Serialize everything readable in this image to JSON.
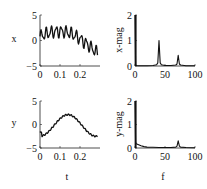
{
  "chart_data": [
    {
      "type": "line",
      "id": "x-time",
      "title": "",
      "xlabel": "",
      "ylabel": "x",
      "xlim": [
        0,
        0.3
      ],
      "ylim": [
        -5,
        5
      ],
      "xticks": [
        0,
        0.1,
        0.2
      ],
      "xtick_labels": [
        "0",
        "0.1",
        "0.2"
      ],
      "yticks": [
        -5,
        0,
        5
      ],
      "ytick_labels": [
        "−5",
        "0",
        "5"
      ],
      "grid": false,
      "description": "Noisy oscillating signal: slow trend rising to ~2 near t=0.1 then declining to ~-2 near t=0.27, with fast oscillation (~40 Hz, amplitude ~1) and a ~72 Hz component (amplitude ~0.4)",
      "x": [
        0,
        0.01,
        0.02,
        0.03,
        0.04,
        0.05,
        0.06,
        0.07,
        0.08,
        0.09,
        0.1,
        0.11,
        0.12,
        0.13,
        0.14,
        0.15,
        0.16,
        0.17,
        0.18,
        0.19,
        0.2,
        0.21,
        0.22,
        0.23,
        0.24,
        0.25,
        0.26,
        0.27,
        0.28,
        0.29
      ],
      "values": [
        -0.5,
        1.2,
        0.6,
        2.0,
        1.0,
        2.6,
        1.2,
        2.8,
        1.1,
        3.0,
        1.2,
        2.6,
        0.8,
        2.3,
        0.4,
        1.8,
        -0.3,
        1.2,
        -0.9,
        0.5,
        -1.5,
        0.0,
        -2.0,
        -0.6,
        -2.4,
        -1.0,
        -2.6,
        -0.8,
        -2.0,
        0.2
      ]
    },
    {
      "type": "line",
      "id": "x-spectrum",
      "title": "",
      "xlabel": "",
      "ylabel": "x-mag",
      "xlim": [
        0,
        100
      ],
      "ylim": [
        0,
        2
      ],
      "xticks": [
        0,
        50,
        100
      ],
      "xtick_labels": [
        "0",
        "50",
        "100"
      ],
      "yticks": [
        0,
        1,
        2
      ],
      "ytick_labels": [
        "0",
        "1",
        "2"
      ],
      "grid": false,
      "peaks": [
        {
          "f": 0,
          "mag": 2.0
        },
        {
          "f": 40,
          "mag": 1.0
        },
        {
          "f": 72,
          "mag": 0.42
        }
      ],
      "x": [
        0,
        1,
        2,
        5,
        10,
        20,
        30,
        36,
        38,
        40,
        42,
        44,
        50,
        60,
        68,
        70,
        72,
        74,
        76,
        85,
        100
      ],
      "values": [
        2.0,
        0.05,
        0.02,
        0.01,
        0.01,
        0.01,
        0.02,
        0.05,
        0.12,
        1.0,
        0.12,
        0.05,
        0.02,
        0.02,
        0.04,
        0.08,
        0.42,
        0.08,
        0.04,
        0.01,
        0.01
      ]
    },
    {
      "type": "line",
      "id": "y-time",
      "title": "",
      "xlabel": "t",
      "ylabel": "y",
      "xlim": [
        0,
        0.3
      ],
      "ylim": [
        -5,
        5
      ],
      "xticks": [
        0,
        0.1,
        0.2
      ],
      "xtick_labels": [
        "0",
        "0.1",
        "0.2"
      ],
      "yticks": [
        -5,
        0,
        5
      ],
      "ytick_labels": [
        "−5",
        "0",
        "5"
      ],
      "grid": false,
      "description": "Smooth signal: starts ~0.3, dips slightly ~-0.3, rises to peak ~2.2 near t=0.14, declines to ~-2 at t=0.29, with small high-frequency ripple",
      "x": [
        0,
        0.01,
        0.02,
        0.03,
        0.04,
        0.05,
        0.06,
        0.07,
        0.08,
        0.09,
        0.1,
        0.11,
        0.12,
        0.13,
        0.14,
        0.15,
        0.16,
        0.17,
        0.18,
        0.19,
        0.2,
        0.21,
        0.22,
        0.23,
        0.24,
        0.25,
        0.26,
        0.27,
        0.28,
        0.29
      ],
      "values": [
        0.8,
        -0.2,
        -0.3,
        -0.2,
        0.0,
        0.2,
        0.5,
        0.9,
        1.3,
        1.6,
        1.9,
        2.1,
        2.2,
        2.2,
        2.1,
        1.9,
        1.6,
        1.2,
        0.8,
        0.4,
        -0.1,
        -0.5,
        -0.9,
        -1.2,
        -1.5,
        -1.7,
        -1.8,
        -1.9,
        -2.0,
        -1.7
      ]
    },
    {
      "type": "line",
      "id": "y-spectrum",
      "title": "",
      "xlabel": "f",
      "ylabel": "y-mag",
      "xlim": [
        0,
        100
      ],
      "ylim": [
        0,
        2
      ],
      "xticks": [
        0,
        50,
        100
      ],
      "xtick_labels": [
        "0",
        "50",
        "100"
      ],
      "yticks": [
        0,
        1,
        2
      ],
      "ytick_labels": [
        "0",
        "1",
        "2"
      ],
      "grid": false,
      "peaks": [
        {
          "f": 0,
          "mag": 2.0
        },
        {
          "f": 72,
          "mag": 0.3
        }
      ],
      "x": [
        0,
        1,
        2,
        5,
        10,
        15,
        20,
        30,
        40,
        50,
        60,
        68,
        70,
        72,
        74,
        76,
        85,
        100
      ],
      "values": [
        2.0,
        0.25,
        0.18,
        0.15,
        0.1,
        0.06,
        0.04,
        0.03,
        0.02,
        0.02,
        0.02,
        0.04,
        0.08,
        0.3,
        0.08,
        0.04,
        0.02,
        0.01
      ]
    }
  ],
  "panels": {
    "x_time": {
      "ylabel": "x"
    },
    "x_spec": {
      "ylabel": "x-mag"
    },
    "y_time": {
      "ylabel": "y",
      "xlabel": "t"
    },
    "y_spec": {
      "ylabel": "y-mag",
      "xlabel": "f"
    }
  }
}
